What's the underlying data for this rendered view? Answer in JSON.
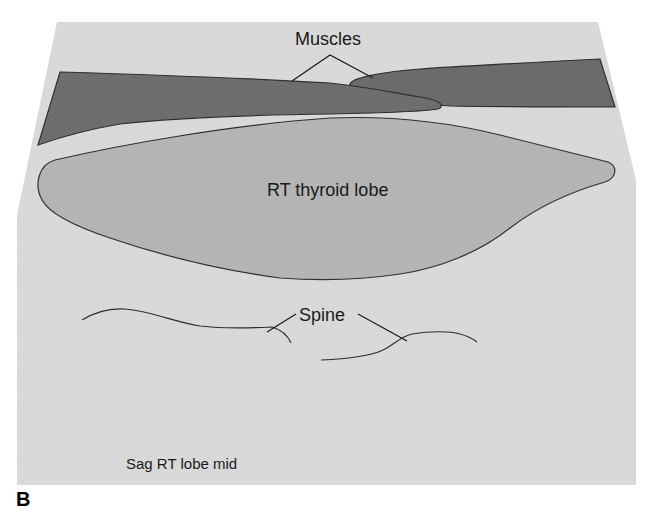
{
  "figure": {
    "panel_letter": "B",
    "view_label": "Sag RT lobe mid",
    "structures": {
      "muscles": "Muscles",
      "thyroid": "RT thyroid lobe",
      "spine": "Spine"
    },
    "colors": {
      "background_panel": "#d8d8d8",
      "muscle_fill": "#6b6b6b",
      "thyroid_fill": "#b3b3b3",
      "outline": "#2e2e2e",
      "text": "#1a1a1a"
    }
  }
}
